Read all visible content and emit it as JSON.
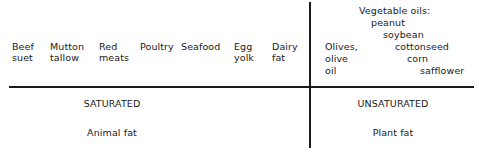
{
  "diagram": {
    "animal_items": [
      {
        "line1": "Beef",
        "line2": "suet"
      },
      {
        "line1": "Mutton",
        "line2": "tallow"
      },
      {
        "line1": "Red",
        "line2": "meats"
      },
      {
        "line1": "Poultry",
        "line2": ""
      },
      {
        "line1": "Seafood",
        "line2": ""
      },
      {
        "line1": "Egg",
        "line2": "yolk"
      },
      {
        "line1": "Dairy",
        "line2": "fat"
      }
    ],
    "plant_items": {
      "olives": [
        "Olives,",
        "olive",
        "oil"
      ],
      "vegetable_oils_heading": "Vegetable oils:",
      "vegetable_oils": [
        "peanut",
        "soybean",
        "cottonseed",
        "corn",
        "safflower"
      ]
    },
    "left_section": {
      "category": "SATURATED",
      "source": "Animal fat"
    },
    "right_section": {
      "category": "UNSATURATED",
      "source": "Plant fat"
    }
  }
}
